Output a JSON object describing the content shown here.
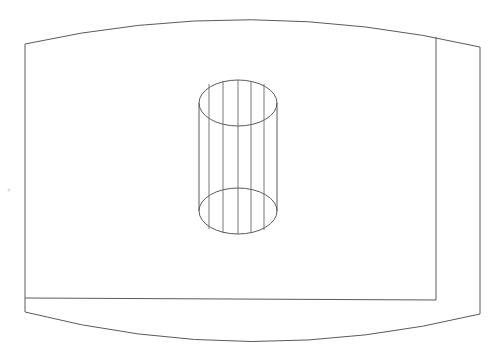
{
  "drawing": {
    "title": "Wireframe cylinder on curved plate",
    "stroke_color": "#5a5a5a",
    "background": "#ffffff",
    "plate": {
      "top_curve": {
        "start": [
          25,
          44
        ],
        "control": [
          250,
          -6
        ],
        "end": [
          480,
          47
        ]
      },
      "bottom_curve": {
        "start": [
          25,
          312
        ],
        "control": [
          250,
          370
        ],
        "end": [
          480,
          314
        ]
      },
      "left_edge_x": 25,
      "right_edge_x": 480,
      "inner_vertical_x": 436,
      "inner_vertical_top_y": 37,
      "inner_vertical_bottom_y": 300,
      "inner_horizontal_y": 298
    },
    "cylinder": {
      "center_x": 238,
      "top_center_y": 103,
      "bottom_center_y": 211,
      "rx": 39,
      "ry": 23,
      "ruling_xs": [
        209,
        223,
        238,
        251,
        264
      ]
    }
  }
}
